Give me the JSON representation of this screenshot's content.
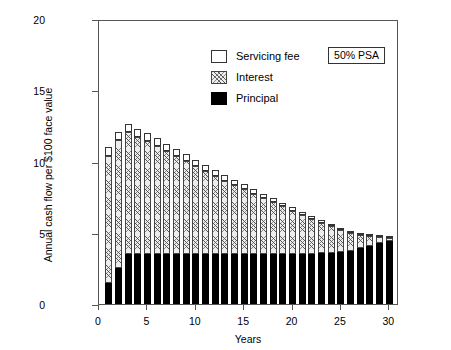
{
  "chart_data": {
    "type": "bar",
    "title": "",
    "subtitle": "",
    "xlabel": "Years",
    "ylabel": "Annual cash flow per $100 face value",
    "xlim": [
      0,
      31
    ],
    "ylim": [
      0,
      20
    ],
    "xticks": [
      0,
      5,
      10,
      15,
      20,
      25,
      30
    ],
    "yticks": [
      0,
      5,
      10,
      15,
      20
    ],
    "grid": false,
    "stacked": true,
    "legend_position": "top-left",
    "annotation": "50% PSA",
    "categories": [
      1,
      2,
      3,
      4,
      5,
      6,
      7,
      8,
      9,
      10,
      11,
      12,
      13,
      14,
      15,
      16,
      17,
      18,
      19,
      20,
      21,
      22,
      23,
      24,
      25,
      26,
      27,
      28,
      29,
      30
    ],
    "series": [
      {
        "name": "Principal",
        "color": "#000000",
        "values": [
          1.5,
          2.55,
          3.5,
          3.5,
          3.5,
          3.5,
          3.5,
          3.5,
          3.5,
          3.5,
          3.5,
          3.5,
          3.5,
          3.5,
          3.5,
          3.5,
          3.5,
          3.5,
          3.5,
          3.5,
          3.5,
          3.5,
          3.55,
          3.6,
          3.65,
          3.75,
          3.9,
          4.05,
          4.25,
          4.45
        ]
      },
      {
        "name": "Interest",
        "color": "#ededed",
        "values": [
          8.9,
          8.95,
          8.55,
          8.25,
          7.95,
          7.6,
          7.25,
          6.9,
          6.55,
          6.2,
          5.85,
          5.5,
          5.15,
          4.85,
          4.55,
          4.25,
          3.95,
          3.65,
          3.35,
          3.05,
          2.75,
          2.45,
          2.15,
          1.85,
          1.55,
          1.25,
          0.95,
          0.7,
          0.45,
          0.2
        ]
      },
      {
        "name": "Servicing fee",
        "color": "#ffffff",
        "values": [
          0.6,
          0.6,
          0.58,
          0.56,
          0.54,
          0.52,
          0.5,
          0.48,
          0.46,
          0.44,
          0.42,
          0.4,
          0.38,
          0.36,
          0.34,
          0.32,
          0.3,
          0.28,
          0.26,
          0.24,
          0.22,
          0.2,
          0.18,
          0.16,
          0.14,
          0.12,
          0.1,
          0.08,
          0.06,
          0.04
        ]
      }
    ],
    "totals": [
      11.0,
      12.1,
      12.63,
      12.31,
      11.99,
      11.62,
      11.25,
      10.88,
      10.51,
      10.14,
      9.77,
      9.4,
      9.03,
      8.71,
      8.39,
      8.07,
      7.75,
      7.43,
      7.11,
      6.79,
      6.47,
      6.15,
      5.88,
      5.61,
      5.34,
      5.12,
      4.95,
      4.83,
      4.76,
      4.69
    ]
  },
  "legend": {
    "items": [
      {
        "label": "Servicing fee",
        "swatch": "service"
      },
      {
        "label": "Interest",
        "swatch": "interest"
      },
      {
        "label": "Principal",
        "swatch": "principal"
      }
    ]
  }
}
